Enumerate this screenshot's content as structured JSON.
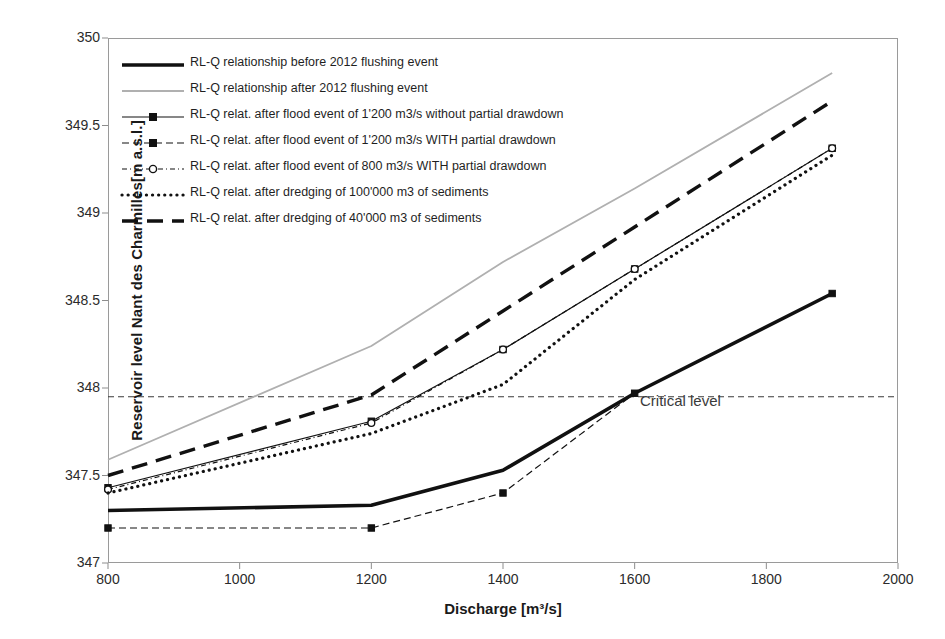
{
  "axes": {
    "xlabel": "Discharge [m³/s]",
    "ylabel": "Reservoir level Nant des Charmilles[m a.s.l.]",
    "xticks": [
      "800",
      "1000",
      "1200",
      "1400",
      "1600",
      "1800",
      "2000"
    ],
    "yticks": [
      "350",
      "349.5",
      "349",
      "348.5",
      "348",
      "347.5",
      "347"
    ]
  },
  "annotations": {
    "critical_level": "Critical level"
  },
  "legend": [
    {
      "label": "RL-Q relationship before 2012 flushing event",
      "style": "solid-thick-black"
    },
    {
      "label": "RL-Q relationship after 2012 flushing event",
      "style": "solid-thin-grey"
    },
    {
      "label": "RL-Q relat. after flood event of 1'200 m3/s without partial drawdown",
      "style": "solid-thin-marker-square"
    },
    {
      "label": "RL-Q relat. after flood event of 1'200 m3/s WITH partial drawdown",
      "style": "dashed-marker-square"
    },
    {
      "label": "RL-Q relat. after flood event of 800 m3/s WITH partial drawdown",
      "style": "dashdot-marker-circle"
    },
    {
      "label": "RL-Q relat. after dredging of 100'000 m3 of sediments",
      "style": "dotted-thick-black"
    },
    {
      "label": "RL-Q relat. after dredging of 40'000 m3 of sediments",
      "style": "longdash-thick-black"
    }
  ],
  "chart_data": {
    "type": "line",
    "title": "",
    "xlabel": "Discharge [m³/s]",
    "ylabel": "Reservoir level Nant des Charmilles[m a.s.l.]",
    "xlim": [
      800,
      2000
    ],
    "ylim": [
      347,
      350
    ],
    "xticks": [
      800,
      1000,
      1200,
      1400,
      1600,
      1800,
      2000
    ],
    "yticks": [
      347,
      347.5,
      348,
      348.5,
      349,
      349.5,
      350
    ],
    "grid": false,
    "legend_position": "upper-left-inside",
    "critical_level": 347.95,
    "series": [
      {
        "name": "RL-Q relationship before 2012 flushing event",
        "x": [
          800,
          1200,
          1400,
          1600,
          1900
        ],
        "values": [
          347.3,
          347.33,
          347.53,
          347.97,
          348.54
        ]
      },
      {
        "name": "RL-Q relationship after 2012 flushing event",
        "x": [
          800,
          1200,
          1400,
          1600,
          1900
        ],
        "values": [
          347.59,
          348.24,
          348.72,
          349.14,
          349.8
        ]
      },
      {
        "name": "RL-Q relat. after flood event of 1'200 m3/s without partial drawdown",
        "x": [
          800,
          1200,
          1400,
          1600,
          1900
        ],
        "values": [
          347.43,
          347.81,
          348.22,
          348.68,
          349.37
        ]
      },
      {
        "name": "RL-Q relat. after flood event of 1'200 m3/s WITH partial drawdown",
        "x": [
          800,
          1200,
          1400,
          1600,
          1900
        ],
        "values": [
          347.2,
          347.2,
          347.4,
          347.97,
          348.54
        ]
      },
      {
        "name": "RL-Q relat. after flood event of 800 m3/s WITH partial drawdown",
        "x": [
          800,
          1200,
          1400,
          1600,
          1900
        ],
        "values": [
          347.42,
          347.8,
          348.22,
          348.68,
          349.37
        ]
      },
      {
        "name": "RL-Q relat. after dredging of 100'000 m3 of sediments",
        "x": [
          800,
          1200,
          1400,
          1600,
          1900
        ],
        "values": [
          347.4,
          347.74,
          348.02,
          348.62,
          349.33
        ]
      },
      {
        "name": "RL-Q relat. after dredging of 40'000 m3 of sediments",
        "x": [
          800,
          1200,
          1400,
          1600,
          1900
        ],
        "values": [
          347.5,
          347.96,
          348.44,
          348.92,
          349.64
        ]
      }
    ]
  }
}
